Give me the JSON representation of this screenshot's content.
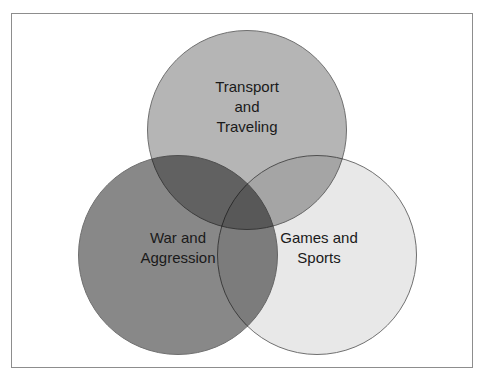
{
  "figure": {
    "type": "venn-diagram",
    "set_count": 3,
    "background_color": "#ffffff",
    "frame": {
      "name": "diagram-frame",
      "border_color": "#8d8d8d",
      "border_width_px": 1
    },
    "circle_outline_color": "#6f6f6f",
    "label_text_color": "#1a1a1a",
    "blend_mode": "multiply"
  },
  "sets": [
    {
      "id": "transport",
      "label": "Transport\nand\nTraveling",
      "label_lines": [
        "Transport",
        "and",
        "Traveling"
      ],
      "position": "top",
      "fill_color": "#b5b5b5",
      "center": {
        "x": 247,
        "y": 130
      },
      "radius": 100
    },
    {
      "id": "war",
      "label": "War and\nAggression",
      "label_lines": [
        "War and",
        "Aggression"
      ],
      "position": "bottom-left",
      "fill_color": "#888888",
      "center": {
        "x": 178,
        "y": 255
      },
      "radius": 100
    },
    {
      "id": "games",
      "label": "Games and\nSports",
      "label_lines": [
        "Games and",
        "Sports"
      ],
      "position": "bottom-right",
      "fill_color": "#e8e8e8",
      "center": {
        "x": 317,
        "y": 255
      },
      "radius": 100
    }
  ]
}
